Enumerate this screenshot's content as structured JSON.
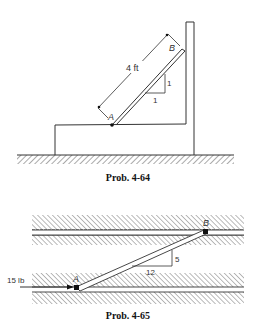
{
  "figures": [
    {
      "caption": "Prob. 4-64",
      "labels": {
        "point_a": "A",
        "point_b": "B",
        "length": "4 ft",
        "slope_rise": "1",
        "slope_run": "1"
      }
    },
    {
      "caption": "Prob. 4-65",
      "labels": {
        "point_a": "A",
        "point_b": "B",
        "force": "15 lb",
        "slope_rise": "5",
        "slope_run": "12"
      }
    }
  ],
  "colors": {
    "line": "#333333",
    "hatch": "#555555",
    "background": "#ffffff"
  }
}
